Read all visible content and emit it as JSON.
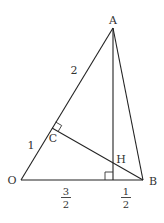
{
  "diagram": {
    "points": {
      "A": {
        "label": "A",
        "x": 113,
        "y": 28
      },
      "O": {
        "label": "O",
        "x": 21,
        "y": 180
      },
      "B": {
        "label": "B",
        "x": 143,
        "y": 180
      },
      "C": {
        "label": "C",
        "x": 52,
        "y": 128
      },
      "H": {
        "label": "H",
        "x": 113,
        "y": 164
      }
    },
    "segment_labels": {
      "AC": "2",
      "CO": "1",
      "O_foot": {
        "num": "3",
        "den": "2"
      },
      "foot_B": {
        "num": "1",
        "den": "2"
      }
    },
    "stroke_color": "#222222"
  }
}
